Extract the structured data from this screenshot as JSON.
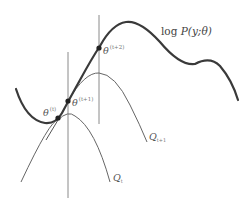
{
  "diagram": {
    "objective_label": {
      "prefix": "log ",
      "func": "P",
      "args": "(y;θ)"
    },
    "points": [
      {
        "id": "theta_t",
        "symbol": "θ",
        "superscript": "(t)"
      },
      {
        "id": "theta_t1",
        "symbol": "θ",
        "superscript": "(t+1)"
      },
      {
        "id": "theta_t2",
        "symbol": "θ",
        "superscript": "(t+2)"
      }
    ],
    "bounds": [
      {
        "id": "Q_t",
        "symbol": "Q",
        "subscript": "t"
      },
      {
        "id": "Q_t1",
        "symbol": "Q",
        "subscript": "t+1"
      }
    ],
    "colors": {
      "main_curve": "#3a3a3a",
      "bound_curves": "#666666",
      "vertical_lines": "#888888",
      "points": "#222222",
      "labels": "#555555"
    }
  }
}
